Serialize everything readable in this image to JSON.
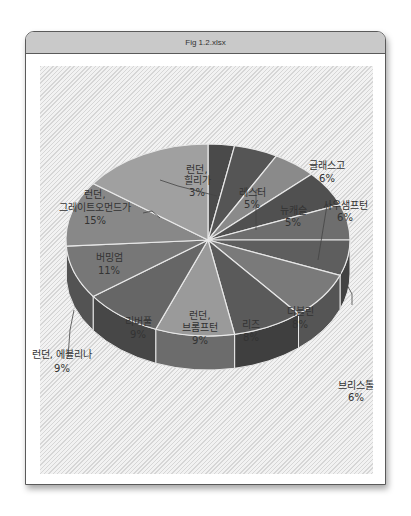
{
  "window": {
    "title": "Fig 1.2.xlsx"
  },
  "chart_data": {
    "type": "pie",
    "style": "3d-pie",
    "title": "",
    "slices": [
      {
        "label": "런던, 힐리가",
        "value": 3,
        "display": "3%"
      },
      {
        "label": "레스터",
        "value": 5,
        "display": "5%"
      },
      {
        "label": "뉴캐슬",
        "value": 5,
        "display": "5%"
      },
      {
        "label": "글래스고",
        "value": 6,
        "display": "6%"
      },
      {
        "label": "사우샘프턴",
        "value": 6,
        "display": "6%"
      },
      {
        "label": "브리스톨",
        "value": 6,
        "display": "6%"
      },
      {
        "label": "더블린",
        "value": 8,
        "display": "8%"
      },
      {
        "label": "리즈",
        "value": 8,
        "display": "8%"
      },
      {
        "label": "런던, 브롬프턴",
        "value": 9,
        "display": "9%"
      },
      {
        "label": "리버풀",
        "value": 9,
        "display": "9%"
      },
      {
        "label": "런던, 에블리나",
        "value": 9,
        "display": "9%"
      },
      {
        "label": "버밍엄",
        "value": 11,
        "display": "11%"
      },
      {
        "label": "런던, 그레이트오먼드가",
        "value": 15,
        "display": "15%"
      }
    ],
    "legend": "none (data labels on/near slices)"
  },
  "labels": {
    "l0a": "런던,",
    "l0b": "힐리가",
    "l0c": "3%",
    "l1a": "레스터",
    "l1b": "5%",
    "l2a": "뉴캐슬",
    "l2b": "5%",
    "l3a": "글래스고",
    "l3b": "6%",
    "l4a": "사우샘프턴",
    "l4b": "6%",
    "l5a": "브리스톨",
    "l5b": "6%",
    "l6a": "더블린",
    "l6b": "8%",
    "l7a": "리즈",
    "l7b": "8%",
    "l8a": "런던,",
    "l8b": "브롬프턴",
    "l8c": "9%",
    "l9a": "리버풀",
    "l9b": "9%",
    "l10a": "런던, 에블리나",
    "l10b": "9%",
    "l11a": "버밍엄",
    "l11b": "11%",
    "l12a": "런던,",
    "l12b": "그레이트오먼드가",
    "l12c": "15%"
  },
  "colors": [
    "#4a4a4a",
    "#555555",
    "#8a8a8a",
    "#505050",
    "#6e6e6e",
    "#5e5e5e",
    "#7a7a7a",
    "#5a5a5a",
    "#9a9a9a",
    "#666666",
    "#777777",
    "#888888",
    "#a0a0a0"
  ]
}
